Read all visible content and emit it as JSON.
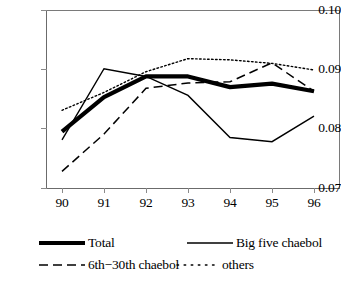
{
  "chart_data": {
    "type": "line",
    "title": "",
    "xlabel": "",
    "ylabel": "",
    "categories": [
      "90",
      "91",
      "92",
      "93",
      "94",
      "95",
      "96"
    ],
    "x": [
      90,
      91,
      92,
      93,
      94,
      95,
      96
    ],
    "xlim": [
      90,
      96
    ],
    "ylim": [
      0.07,
      0.1
    ],
    "yticks": [
      "0.10",
      "0.09",
      "0.08",
      "0.07"
    ],
    "ytick_values": [
      0.1,
      0.09,
      0.08,
      0.07
    ],
    "grid": false,
    "legend_position": "below-plot",
    "series": [
      {
        "name": "Total",
        "style": "thick-solid",
        "values": [
          0.0795,
          0.0853,
          0.0888,
          0.0888,
          0.087,
          0.0876,
          0.0863
        ]
      },
      {
        "name": "Big five chaebol",
        "style": "solid",
        "values": [
          0.0781,
          0.0901,
          0.0888,
          0.0856,
          0.0785,
          0.0778,
          0.0821
        ]
      },
      {
        "name": "6th−30th chaebol",
        "style": "dashed",
        "values": [
          0.0728,
          0.0791,
          0.0868,
          0.0877,
          0.0879,
          0.0911,
          0.0863
        ]
      },
      {
        "name": "others",
        "style": "dotted",
        "values": [
          0.0831,
          0.0861,
          0.0896,
          0.0918,
          0.0916,
          0.091,
          0.0899
        ]
      }
    ]
  },
  "axes": {
    "y_labels": [
      "0.10",
      "0.09",
      "0.08",
      "0.07"
    ],
    "x_labels": [
      "90",
      "91",
      "92",
      "93",
      "94",
      "95",
      "96"
    ]
  },
  "legend": {
    "items": [
      {
        "label": "Total",
        "style": "thick-solid"
      },
      {
        "label": "Big five chaebol",
        "style": "solid"
      },
      {
        "label": "6th−30th chaebol",
        "style": "dashed"
      },
      {
        "label": "others",
        "style": "dotted"
      }
    ]
  },
  "colors": {
    "line": "#000000",
    "axis": "#808080",
    "background": "#ffffff"
  }
}
